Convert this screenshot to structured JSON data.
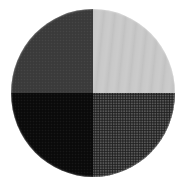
{
  "figure": {
    "name": "four-quadrant-grayscale-disc",
    "background_color": "#ffffff",
    "canvas": {
      "width": 193,
      "height": 190
    },
    "shape": "circle",
    "circle": {
      "center_x": 93,
      "center_y": 93,
      "diameter": 164,
      "left": 11,
      "top": 9,
      "width": 164,
      "height": 168,
      "outline": "none"
    },
    "quadrants": [
      {
        "position": "top-left",
        "label": "dark charcoal",
        "color": "#3a3a3a",
        "texture": "fine grain"
      },
      {
        "position": "top-right",
        "label": "light gray",
        "color": "#c9c9c9",
        "texture": "soft vertical banding"
      },
      {
        "position": "bottom-left",
        "label": "black",
        "color": "#0a0a0a",
        "texture": "fine grain"
      },
      {
        "position": "bottom-right",
        "label": "medium dark gray",
        "color": "#4a4a4a",
        "texture": "halftone dot screen"
      }
    ]
  }
}
